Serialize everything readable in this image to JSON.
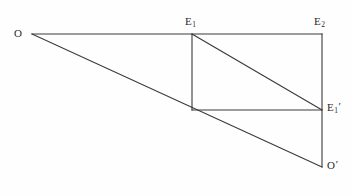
{
  "figure": {
    "type": "geometry-diagram",
    "background_color": "#fefefe",
    "stroke_color": "#3a3a3a",
    "stroke_width": 1.1,
    "canvas": {
      "width": 351,
      "height": 196
    }
  },
  "labels": {
    "o": {
      "text": "O",
      "sub": "",
      "prime": "",
      "x": 14,
      "y": 28
    },
    "e1": {
      "text": "E",
      "sub": "1",
      "prime": "",
      "x": 185,
      "y": 16
    },
    "e2": {
      "text": "E",
      "sub": "2",
      "prime": "",
      "x": 314,
      "y": 16
    },
    "e1p": {
      "text": "E",
      "sub": "1",
      "prime": "′",
      "x": 327,
      "y": 102
    },
    "op": {
      "text": "O",
      "sub": "",
      "prime": "′",
      "x": 327,
      "y": 160
    }
  },
  "points": {
    "O": {
      "x": 32,
      "y": 34,
      "name": "O"
    },
    "E1": {
      "x": 192,
      "y": 34,
      "name": "E1"
    },
    "E2": {
      "x": 322,
      "y": 34,
      "name": "E2"
    },
    "P": {
      "x": 192,
      "y": 110,
      "name": "inner-bottom-left"
    },
    "E1p": {
      "x": 322,
      "y": 110,
      "name": "E1-prime"
    },
    "Op": {
      "x": 322,
      "y": 167,
      "name": "O-prime"
    }
  },
  "segments": [
    {
      "id": "top-ray",
      "name": "ray-O-to-E2",
      "x1": 32,
      "y1": 34,
      "x2": 322,
      "y2": 34
    },
    {
      "id": "lower-ray",
      "name": "ray-O-to-O-prime",
      "x1": 32,
      "y1": 34,
      "x2": 322,
      "y2": 167
    },
    {
      "id": "right-edge",
      "name": "segment-E2-to-O-prime",
      "x1": 322,
      "y1": 34,
      "x2": 322,
      "y2": 167
    },
    {
      "id": "inner-vertical",
      "name": "segment-E1-to-P",
      "x1": 192,
      "y1": 34,
      "x2": 192,
      "y2": 110
    },
    {
      "id": "inner-horizontal",
      "name": "segment-P-to-E1-prime",
      "x1": 192,
      "y1": 110,
      "x2": 322,
      "y2": 110
    },
    {
      "id": "inner-diagonal",
      "name": "segment-E1-to-E1-prime",
      "x1": 192,
      "y1": 34,
      "x2": 322,
      "y2": 110
    }
  ]
}
